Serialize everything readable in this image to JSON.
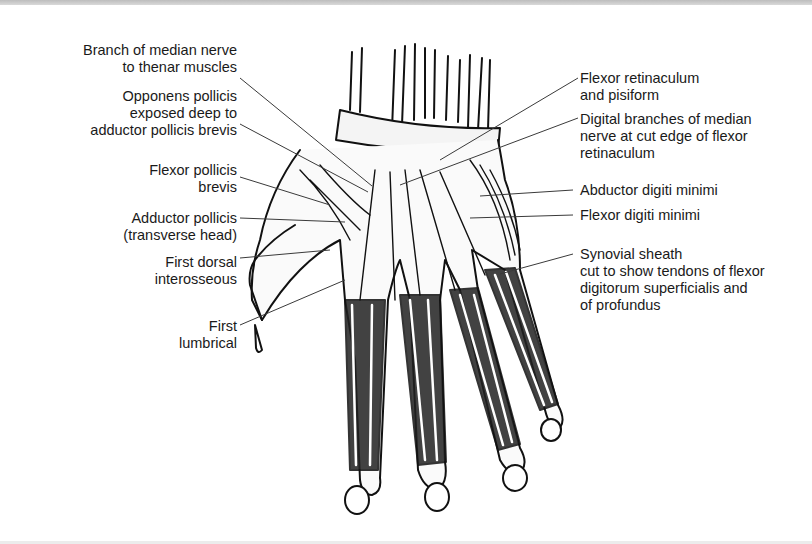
{
  "figure": {
    "colors": {
      "ink": "#111111",
      "leader": "#3a3a3a",
      "paper": "#ffffff"
    }
  },
  "labels": {
    "left": [
      {
        "id": "branch-median",
        "text": "Branch of median nerve\nto thenar muscles"
      },
      {
        "id": "opponens",
        "text": "Opponens pollicis\nexposed deep to\nadductor pollicis brevis"
      },
      {
        "id": "fpb",
        "text": "Flexor pollicis\nbrevis"
      },
      {
        "id": "adductor",
        "text": "Adductor pollicis\n(transverse head)"
      },
      {
        "id": "first-dorsal",
        "text": "First dorsal\ninterosseous"
      },
      {
        "id": "first-lumbrical",
        "text": "First\nlumbrical"
      }
    ],
    "right": [
      {
        "id": "flexor-retinaculum",
        "text": "Flexor retinaculum\nand pisiform"
      },
      {
        "id": "digital-branches",
        "text": "Digital branches of median\nnerve at cut edge of flexor\nretinaculum"
      },
      {
        "id": "abductor-dm",
        "text": "Abductor digiti minimi"
      },
      {
        "id": "flexor-dm",
        "text": "Flexor digiti minimi"
      },
      {
        "id": "synovial",
        "text": "Synovial sheath\ncut to show tendons of flexor\ndigitorum superficialis and\nof profundus"
      }
    ]
  }
}
